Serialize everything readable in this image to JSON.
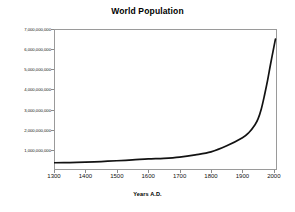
{
  "chart_data": {
    "type": "line",
    "title": "World Population",
    "xlabel": "Years A.D.",
    "ylabel": "",
    "xlim": [
      1300,
      2010
    ],
    "ylim": [
      0,
      7000000000
    ],
    "grid": false,
    "legend": "none",
    "x_tick_labels": [
      "1300",
      "1400",
      "1500",
      "1600",
      "1700",
      "1800",
      "1900",
      "2000"
    ],
    "x_ticks": [
      1300,
      1400,
      1500,
      1600,
      1700,
      1800,
      1900,
      2000
    ],
    "y_tick_labels": [
      "1,000,000,000",
      "2,000,000,000",
      "3,000,000,000",
      "4,000,000,000",
      "5,000,000,000",
      "6,000,000,000",
      "7,000,000,000"
    ],
    "y_ticks": [
      1000000000,
      2000000000,
      3000000000,
      4000000000,
      5000000000,
      6000000000,
      7000000000
    ],
    "series": [
      {
        "name": "World Population",
        "color": "#121212",
        "x": [
          1300,
          1350,
          1400,
          1450,
          1500,
          1550,
          1600,
          1650,
          1700,
          1750,
          1800,
          1850,
          1900,
          1920,
          1940,
          1950,
          1960,
          1970,
          1980,
          1990,
          2000,
          2005
        ],
        "values": [
          360000000,
          370000000,
          390000000,
          420000000,
          460000000,
          500000000,
          550000000,
          580000000,
          640000000,
          750000000,
          900000000,
          1200000000,
          1600000000,
          1850000000,
          2250000000,
          2550000000,
          3030000000,
          3700000000,
          4450000000,
          5300000000,
          6100000000,
          6500000000
        ]
      }
    ]
  }
}
